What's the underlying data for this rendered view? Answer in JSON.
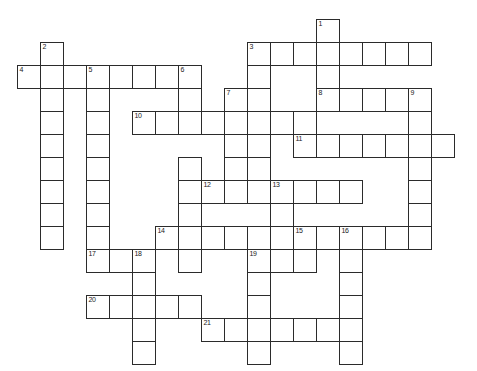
{
  "puzzle": {
    "kind": "crossword-grid",
    "title": "",
    "background_color": "#ffffff",
    "cell_border_color": "#2b2b2b",
    "cell_fill_color": "#ffffff",
    "number_color": "#1a1a1a",
    "cell_size_px": 23,
    "origin_x_px": 17,
    "origin_y_px": 19,
    "columns": 20,
    "rows": 15,
    "entries": [
      {
        "number": "1",
        "direction": "down",
        "col": 13,
        "row": 0,
        "length": 5
      },
      {
        "number": "2",
        "direction": "down",
        "col": 1,
        "row": 1,
        "length": 10
      },
      {
        "number": "3",
        "direction": "across",
        "col": 10,
        "row": 1,
        "length": 8
      },
      {
        "number": "3",
        "direction": "down",
        "col": 10,
        "row": 1,
        "length": 6
      },
      {
        "number": "4",
        "direction": "across",
        "col": 0,
        "row": 2,
        "length": 8
      },
      {
        "number": "5",
        "direction": "down",
        "col": 3,
        "row": 2,
        "length": 9
      },
      {
        "number": "6",
        "direction": "down",
        "col": 7,
        "row": 2,
        "length": 8
      },
      {
        "number": "7",
        "direction": "down",
        "col": 9,
        "row": 3,
        "length": 6
      },
      {
        "number": "8",
        "direction": "across",
        "col": 13,
        "row": 3,
        "length": 5
      },
      {
        "number": "9",
        "direction": "down",
        "col": 17,
        "row": 3,
        "length": 5
      },
      {
        "number": "10",
        "direction": "across",
        "col": 5,
        "row": 4,
        "length": 8
      },
      {
        "number": "11",
        "direction": "across",
        "col": 12,
        "row": 5,
        "length": 7
      },
      {
        "number": "12",
        "direction": "across",
        "col": 8,
        "row": 7,
        "length": 7
      },
      {
        "number": "13",
        "direction": "down",
        "col": 11,
        "row": 7,
        "length": 6
      },
      {
        "number": "14",
        "direction": "across",
        "col": 6,
        "row": 9,
        "length": 6
      },
      {
        "number": "15",
        "direction": "across",
        "col": 12,
        "row": 9,
        "length": 6
      },
      {
        "number": "15",
        "direction": "down",
        "col": 12,
        "row": 9,
        "length": 3
      },
      {
        "number": "16",
        "direction": "down",
        "col": 14,
        "row": 9,
        "length": 6
      },
      {
        "number": "17",
        "direction": "across",
        "col": 3,
        "row": 10,
        "length": 3
      },
      {
        "number": "18",
        "direction": "down",
        "col": 5,
        "row": 10,
        "length": 5
      },
      {
        "number": "19",
        "direction": "down",
        "col": 10,
        "row": 10,
        "length": 5
      },
      {
        "number": "20",
        "direction": "across",
        "col": 3,
        "row": 12,
        "length": 5
      },
      {
        "number": "21",
        "direction": "across",
        "col": 8,
        "row": 13,
        "length": 6
      }
    ],
    "cells": [
      {
        "col": 1,
        "row": 1,
        "num": "2"
      },
      {
        "col": 13,
        "row": 1,
        "num": null
      },
      {
        "col": 13,
        "row": 0,
        "num": "1"
      },
      {
        "col": 10,
        "row": 1,
        "num": "3"
      },
      {
        "col": 11,
        "row": 1,
        "num": null
      },
      {
        "col": 12,
        "row": 1,
        "num": null
      },
      {
        "col": 14,
        "row": 1,
        "num": null
      },
      {
        "col": 15,
        "row": 1,
        "num": null
      },
      {
        "col": 16,
        "row": 1,
        "num": null
      },
      {
        "col": 17,
        "row": 1,
        "num": null
      },
      {
        "col": 0,
        "row": 2,
        "num": "4"
      },
      {
        "col": 2,
        "row": 2,
        "num": null
      },
      {
        "col": 3,
        "row": 2,
        "num": "5"
      },
      {
        "col": 4,
        "row": 2,
        "num": null
      },
      {
        "col": 5,
        "row": 2,
        "num": null
      },
      {
        "col": 6,
        "row": 2,
        "num": null
      },
      {
        "col": 7,
        "row": 2,
        "num": "6"
      },
      {
        "col": 1,
        "row": 2,
        "num": null
      },
      {
        "col": 10,
        "row": 2,
        "num": null
      },
      {
        "col": 13,
        "row": 2,
        "num": null
      },
      {
        "col": 1,
        "row": 3,
        "num": null
      },
      {
        "col": 3,
        "row": 3,
        "num": null
      },
      {
        "col": 7,
        "row": 3,
        "num": null
      },
      {
        "col": 9,
        "row": 3,
        "num": "7"
      },
      {
        "col": 10,
        "row": 3,
        "num": null
      },
      {
        "col": 13,
        "row": 3,
        "num": "8"
      },
      {
        "col": 14,
        "row": 3,
        "num": null
      },
      {
        "col": 15,
        "row": 3,
        "num": null
      },
      {
        "col": 16,
        "row": 3,
        "num": null
      },
      {
        "col": 17,
        "row": 3,
        "num": "9"
      },
      {
        "col": 1,
        "row": 4,
        "num": null
      },
      {
        "col": 3,
        "row": 4,
        "num": null
      },
      {
        "col": 5,
        "row": 4,
        "num": "10"
      },
      {
        "col": 6,
        "row": 4,
        "num": null
      },
      {
        "col": 7,
        "row": 4,
        "num": null
      },
      {
        "col": 8,
        "row": 4,
        "num": null
      },
      {
        "col": 9,
        "row": 4,
        "num": null
      },
      {
        "col": 10,
        "row": 4,
        "num": null
      },
      {
        "col": 11,
        "row": 4,
        "num": null
      },
      {
        "col": 12,
        "row": 4,
        "num": null
      },
      {
        "col": 17,
        "row": 4,
        "num": null
      },
      {
        "col": 1,
        "row": 5,
        "num": null
      },
      {
        "col": 3,
        "row": 5,
        "num": null
      },
      {
        "col": 9,
        "row": 5,
        "num": null
      },
      {
        "col": 10,
        "row": 5,
        "num": null
      },
      {
        "col": 12,
        "row": 5,
        "num": "11"
      },
      {
        "col": 13,
        "row": 5,
        "num": null
      },
      {
        "col": 14,
        "row": 5,
        "num": null
      },
      {
        "col": 15,
        "row": 5,
        "num": null
      },
      {
        "col": 16,
        "row": 5,
        "num": null
      },
      {
        "col": 17,
        "row": 5,
        "num": null
      },
      {
        "col": 18,
        "row": 5,
        "num": null
      },
      {
        "col": 1,
        "row": 6,
        "num": null
      },
      {
        "col": 3,
        "row": 6,
        "num": null
      },
      {
        "col": 7,
        "row": 6,
        "num": null
      },
      {
        "col": 9,
        "row": 6,
        "num": null
      },
      {
        "col": 10,
        "row": 6,
        "num": null
      },
      {
        "col": 17,
        "row": 6,
        "num": null
      },
      {
        "col": 1,
        "row": 7,
        "num": null
      },
      {
        "col": 3,
        "row": 7,
        "num": null
      },
      {
        "col": 7,
        "row": 7,
        "num": null
      },
      {
        "col": 8,
        "row": 7,
        "num": "12"
      },
      {
        "col": 9,
        "row": 7,
        "num": null
      },
      {
        "col": 10,
        "row": 7,
        "num": null
      },
      {
        "col": 11,
        "row": 7,
        "num": "13"
      },
      {
        "col": 12,
        "row": 7,
        "num": null
      },
      {
        "col": 13,
        "row": 7,
        "num": null
      },
      {
        "col": 14,
        "row": 7,
        "num": null
      },
      {
        "col": 17,
        "row": 7,
        "num": null
      },
      {
        "col": 1,
        "row": 8,
        "num": null
      },
      {
        "col": 3,
        "row": 8,
        "num": null
      },
      {
        "col": 7,
        "row": 8,
        "num": null
      },
      {
        "col": 11,
        "row": 8,
        "num": null
      },
      {
        "col": 17,
        "row": 8,
        "num": null
      },
      {
        "col": 1,
        "row": 9,
        "num": null
      },
      {
        "col": 3,
        "row": 9,
        "num": null
      },
      {
        "col": 6,
        "row": 9,
        "num": "14"
      },
      {
        "col": 7,
        "row": 9,
        "num": null
      },
      {
        "col": 8,
        "row": 9,
        "num": null
      },
      {
        "col": 9,
        "row": 9,
        "num": null
      },
      {
        "col": 10,
        "row": 9,
        "num": null
      },
      {
        "col": 11,
        "row": 9,
        "num": null
      },
      {
        "col": 12,
        "row": 9,
        "num": "15"
      },
      {
        "col": 13,
        "row": 9,
        "num": null
      },
      {
        "col": 14,
        "row": 9,
        "num": "16"
      },
      {
        "col": 15,
        "row": 9,
        "num": null
      },
      {
        "col": 16,
        "row": 9,
        "num": null
      },
      {
        "col": 17,
        "row": 9,
        "num": null
      },
      {
        "col": 3,
        "row": 10,
        "num": "17"
      },
      {
        "col": 4,
        "row": 10,
        "num": null
      },
      {
        "col": 5,
        "row": 10,
        "num": "18"
      },
      {
        "col": 7,
        "row": 10,
        "num": null
      },
      {
        "col": 10,
        "row": 10,
        "num": "19"
      },
      {
        "col": 11,
        "row": 10,
        "num": null
      },
      {
        "col": 12,
        "row": 10,
        "num": null
      },
      {
        "col": 14,
        "row": 10,
        "num": null
      },
      {
        "col": 5,
        "row": 11,
        "num": null
      },
      {
        "col": 10,
        "row": 11,
        "num": null
      },
      {
        "col": 14,
        "row": 11,
        "num": null
      },
      {
        "col": 3,
        "row": 12,
        "num": "20"
      },
      {
        "col": 4,
        "row": 12,
        "num": null
      },
      {
        "col": 5,
        "row": 12,
        "num": null
      },
      {
        "col": 6,
        "row": 12,
        "num": null
      },
      {
        "col": 7,
        "row": 12,
        "num": null
      },
      {
        "col": 10,
        "row": 12,
        "num": null
      },
      {
        "col": 14,
        "row": 12,
        "num": null
      },
      {
        "col": 5,
        "row": 13,
        "num": null
      },
      {
        "col": 8,
        "row": 13,
        "num": "21"
      },
      {
        "col": 9,
        "row": 13,
        "num": null
      },
      {
        "col": 10,
        "row": 13,
        "num": null
      },
      {
        "col": 11,
        "row": 13,
        "num": null
      },
      {
        "col": 12,
        "row": 13,
        "num": null
      },
      {
        "col": 13,
        "row": 13,
        "num": null
      },
      {
        "col": 14,
        "row": 13,
        "num": null
      },
      {
        "col": 5,
        "row": 14,
        "num": null
      },
      {
        "col": 10,
        "row": 14,
        "num": null
      },
      {
        "col": 14,
        "row": 14,
        "num": null
      }
    ]
  }
}
